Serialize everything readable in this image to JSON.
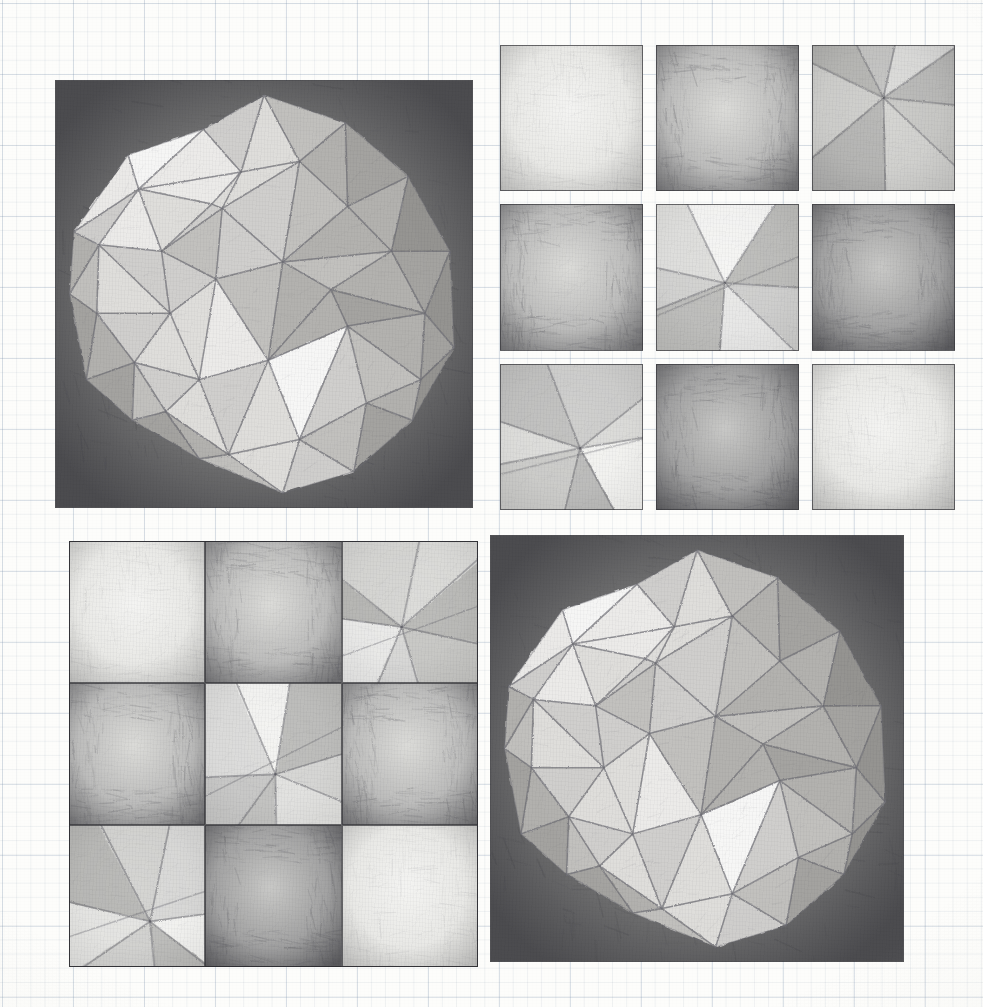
{
  "artwork": {
    "title": "Geodesic sphere and tonal square studies",
    "medium": "graphite pencil on graph paper",
    "sheet_width": 983,
    "sheet_height": 1007,
    "background_color": "#fdfdfb",
    "grid_line_color": "#8fa2b8",
    "graphite_dark": "#3a3a40",
    "graphite_mid": "#8e8e93",
    "graphite_light": "#cfcfce",
    "paper_white": "#f8f8f6"
  },
  "panels": [
    {
      "id": "sphere-top-left",
      "label": "Triangulated sphere study (upper left)",
      "x": 55,
      "y": 80,
      "w": 418,
      "h": 428,
      "subject": "faceted geodesic sphere on dark shaded square ground",
      "facet_count": 40,
      "ground_tone": "dark",
      "sphere_cx": 0.5,
      "sphere_cy": 0.5,
      "sphere_r": 0.465
    },
    {
      "id": "sphere-bottom-right",
      "label": "Triangulated sphere study (lower right)",
      "x": 490,
      "y": 535,
      "w": 414,
      "h": 427,
      "subject": "faceted geodesic sphere on dark shaded square ground",
      "facet_count": 40,
      "ground_tone": "dark",
      "sphere_cx": 0.505,
      "sphere_cy": 0.505,
      "sphere_r": 0.455
    }
  ],
  "grids": [
    {
      "id": "grid-top-right",
      "label": "Nine tonal square studies, spaced",
      "x": 500,
      "y": 45,
      "w": 455,
      "h": 465,
      "rows": 3,
      "cols": 3,
      "gap": 13,
      "contiguous": false,
      "cells": [
        {
          "index": 0,
          "name": "cell-r1c1",
          "motif": "soft-vignette",
          "tone": "light",
          "desc": "even light graphite with darker edges"
        },
        {
          "index": 1,
          "name": "cell-r1c2",
          "motif": "frame-vignette",
          "tone": "mid-dark",
          "desc": "dark border band fading to lighter centre"
        },
        {
          "index": 2,
          "name": "cell-r1c3",
          "motif": "radial-fan",
          "tone": "mid",
          "desc": "rays converging to an upper-centre point"
        },
        {
          "index": 3,
          "name": "cell-r2c1",
          "motif": "frame-vignette",
          "tone": "mid-dark",
          "desc": "heavy dark vertical edges, pale centre"
        },
        {
          "index": 4,
          "name": "cell-r2c2",
          "motif": "facet-cluster",
          "tone": "light-mid",
          "desc": "triangular facets radiating from a lower-centre vertex"
        },
        {
          "index": 5,
          "name": "cell-r2c3",
          "motif": "frame-vignette",
          "tone": "dark",
          "desc": "dark vertical stroke texture, lighter right centre"
        },
        {
          "index": 6,
          "name": "cell-r3c1",
          "motif": "facet-cluster",
          "tone": "mid",
          "desc": "crossed triangles with a bright lower facet"
        },
        {
          "index": 7,
          "name": "cell-r3c2",
          "motif": "frame-vignette",
          "tone": "dark",
          "desc": "strong dark frame, soft light core"
        },
        {
          "index": 8,
          "name": "cell-r3c3",
          "motif": "soft-vignette",
          "tone": "light",
          "desc": "lightest square, faint edge shading"
        }
      ]
    },
    {
      "id": "grid-bottom-left",
      "label": "Nine tonal square studies, contiguous",
      "x": 69,
      "y": 541,
      "w": 409,
      "h": 426,
      "rows": 3,
      "cols": 3,
      "gap": 0,
      "contiguous": true,
      "cells": [
        {
          "index": 0,
          "name": "cell-r1c1",
          "motif": "soft-vignette",
          "tone": "light",
          "desc": "pale square, light edge shading"
        },
        {
          "index": 1,
          "name": "cell-r1c2",
          "motif": "frame-vignette",
          "tone": "mid-dark",
          "desc": "dark frame around a light centre"
        },
        {
          "index": 2,
          "name": "cell-r1c3",
          "motif": "facet-cluster",
          "tone": "mid",
          "desc": "triangular facets meeting at a left vertex"
        },
        {
          "index": 3,
          "name": "cell-r2c1",
          "motif": "frame-vignette",
          "tone": "mid-dark",
          "desc": "dark left and right edges, pale middle"
        },
        {
          "index": 4,
          "name": "cell-r2c2",
          "motif": "facet-cluster",
          "tone": "light-mid",
          "desc": "star of facets with a bright lower-left triangle"
        },
        {
          "index": 5,
          "name": "cell-r2c3",
          "motif": "frame-vignette",
          "tone": "mid-dark",
          "desc": "dark surround with soft light core"
        },
        {
          "index": 6,
          "name": "cell-r3c1",
          "motif": "facet-cluster",
          "tone": "mid",
          "desc": "fan of facets with dark lower-left wedge"
        },
        {
          "index": 7,
          "name": "cell-r3c2",
          "motif": "frame-vignette",
          "tone": "dark",
          "desc": "darkest square, heavy even tone"
        },
        {
          "index": 8,
          "name": "cell-r3c3",
          "motif": "soft-vignette",
          "tone": "light",
          "desc": "light square, faint vertical strokes"
        }
      ]
    }
  ],
  "sphere_facets": {
    "note": "Facet polygons are given in 0-1 normalised panel coordinates with a tone key.",
    "tones": {
      "t0": "#fbfbfa",
      "t1": "#efeeec",
      "t2": "#e2e1de",
      "t3": "#d3d2cf",
      "t4": "#c4c3c0",
      "t5": "#b5b4b1",
      "t6": "#a6a5a2",
      "t7": "#979693",
      "t8": "#888784"
    },
    "list": [
      {
        "p": "0.50,0.035 0.355,0.115 0.445,0.215",
        "t": "t3"
      },
      {
        "p": "0.50,0.035 0.445,0.215 0.585,0.19",
        "t": "t2"
      },
      {
        "p": "0.50,0.035 0.585,0.19 0.695,0.10",
        "t": "t4"
      },
      {
        "p": "0.695,0.10 0.585,0.19 0.70,0.295",
        "t": "t5"
      },
      {
        "p": "0.695,0.10 0.70,0.295 0.845,0.225",
        "t": "t6"
      },
      {
        "p": "0.845,0.225 0.70,0.295 0.805,0.40",
        "t": "t5"
      },
      {
        "p": "0.845,0.225 0.805,0.40 0.945,0.40",
        "t": "t7"
      },
      {
        "p": "0.945,0.40 0.805,0.40 0.885,0.545",
        "t": "t6"
      },
      {
        "p": "0.945,0.40 0.885,0.545 0.955,0.625",
        "t": "t7"
      },
      {
        "p": "0.955,0.625 0.885,0.545 0.875,0.70",
        "t": "t6"
      },
      {
        "p": "0.955,0.625 0.875,0.70 0.855,0.795",
        "t": "t7"
      },
      {
        "p": "0.855,0.795 0.875,0.70 0.745,0.755",
        "t": "t5"
      },
      {
        "p": "0.855,0.795 0.745,0.755 0.715,0.915",
        "t": "t6"
      },
      {
        "p": "0.715,0.915 0.745,0.755 0.585,0.84",
        "t": "t4"
      },
      {
        "p": "0.715,0.915 0.585,0.84 0.545,0.965",
        "t": "t3"
      },
      {
        "p": "0.545,0.965 0.585,0.84 0.415,0.875",
        "t": "t2"
      },
      {
        "p": "0.545,0.965 0.415,0.875 0.345,0.885",
        "t": "t4"
      },
      {
        "p": "0.345,0.885 0.415,0.875 0.265,0.775",
        "t": "t5"
      },
      {
        "p": "0.345,0.885 0.265,0.775 0.185,0.795",
        "t": "t6"
      },
      {
        "p": "0.185,0.795 0.265,0.775 0.19,0.66",
        "t": "t4"
      },
      {
        "p": "0.185,0.795 0.19,0.66 0.075,0.70",
        "t": "t6"
      },
      {
        "p": "0.075,0.70 0.19,0.66 0.10,0.545",
        "t": "t5"
      },
      {
        "p": "0.075,0.70 0.10,0.545 0.035,0.50",
        "t": "t6"
      },
      {
        "p": "0.035,0.50 0.10,0.545 0.105,0.385",
        "t": "t4"
      },
      {
        "p": "0.035,0.50 0.105,0.385 0.045,0.355",
        "t": "t5"
      },
      {
        "p": "0.045,0.355 0.105,0.385 0.20,0.255",
        "t": "t3"
      },
      {
        "p": "0.045,0.355 0.20,0.255 0.175,0.175",
        "t": "t1"
      },
      {
        "p": "0.175,0.175 0.20,0.255 0.355,0.115",
        "t": "t0"
      },
      {
        "p": "0.355,0.115 0.20,0.255 0.445,0.215",
        "t": "t1"
      },
      {
        "p": "0.445,0.215 0.20,0.255 0.375,0.29",
        "t": "t1"
      },
      {
        "p": "0.445,0.215 0.375,0.29 0.40,0.30",
        "t": "t2"
      },
      {
        "p": "0.585,0.19 0.445,0.215 0.40,0.30",
        "t": "t2"
      },
      {
        "p": "0.585,0.19 0.40,0.30 0.545,0.425",
        "t": "t3"
      },
      {
        "p": "0.70,0.295 0.585,0.19 0.545,0.425",
        "t": "t4"
      },
      {
        "p": "0.805,0.40 0.70,0.295 0.545,0.425",
        "t": "t5"
      },
      {
        "p": "0.805,0.40 0.545,0.425 0.66,0.49",
        "t": "t4"
      },
      {
        "p": "0.885,0.545 0.805,0.40 0.66,0.49",
        "t": "t5"
      },
      {
        "p": "0.885,0.545 0.66,0.49 0.70,0.575",
        "t": "t6"
      },
      {
        "p": "0.875,0.70 0.885,0.545 0.70,0.575",
        "t": "t5"
      },
      {
        "p": "0.745,0.755 0.875,0.70 0.70,0.575",
        "t": "t4"
      },
      {
        "p": "0.585,0.84 0.745,0.755 0.70,0.575",
        "t": "t3"
      },
      {
        "p": "0.585,0.84 0.70,0.575 0.51,0.655",
        "t": "t0"
      },
      {
        "p": "0.415,0.875 0.585,0.84 0.51,0.655",
        "t": "t2"
      },
      {
        "p": "0.415,0.875 0.51,0.655 0.345,0.70",
        "t": "t3"
      },
      {
        "p": "0.265,0.775 0.415,0.875 0.345,0.70",
        "t": "t2"
      },
      {
        "p": "0.19,0.66 0.265,0.775 0.345,0.70",
        "t": "t3"
      },
      {
        "p": "0.19,0.66 0.345,0.70 0.275,0.545",
        "t": "t2"
      },
      {
        "p": "0.10,0.545 0.19,0.66 0.275,0.545",
        "t": "t3"
      },
      {
        "p": "0.105,0.385 0.10,0.545 0.275,0.545",
        "t": "t2"
      },
      {
        "p": "0.105,0.385 0.275,0.545 0.255,0.40",
        "t": "t3"
      },
      {
        "p": "0.20,0.255 0.105,0.385 0.255,0.40",
        "t": "t1"
      },
      {
        "p": "0.20,0.255 0.255,0.40 0.375,0.29",
        "t": "t2"
      },
      {
        "p": "0.375,0.29 0.255,0.40 0.40,0.30",
        "t": "t3"
      },
      {
        "p": "0.40,0.30 0.255,0.40 0.385,0.465",
        "t": "t4"
      },
      {
        "p": "0.545,0.425 0.40,0.30 0.385,0.465",
        "t": "t3"
      },
      {
        "p": "0.545,0.425 0.385,0.465 0.51,0.655",
        "t": "t4"
      },
      {
        "p": "0.66,0.49 0.545,0.425 0.51,0.655",
        "t": "t5"
      },
      {
        "p": "0.70,0.575 0.66,0.49 0.51,0.655",
        "t": "t5"
      },
      {
        "p": "0.255,0.40 0.275,0.545 0.385,0.465",
        "t": "t3"
      },
      {
        "p": "0.275,0.545 0.345,0.70 0.385,0.465",
        "t": "t2"
      },
      {
        "p": "0.345,0.70 0.51,0.655 0.385,0.465",
        "t": "t1"
      }
    ]
  }
}
